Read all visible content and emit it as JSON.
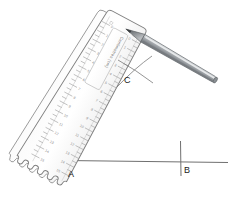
{
  "figure": {
    "background_color": "#ffffff",
    "line_color": "#6e6e6e",
    "label_color": "#1a1a1a"
  },
  "points": [
    {
      "id": "A",
      "label": "A",
      "x": 72,
      "y": 160,
      "role": "vertex-of-angle"
    },
    {
      "id": "B",
      "label": "B",
      "x": 184,
      "y": 168,
      "role": "point-on-base-line"
    },
    {
      "id": "C",
      "label": "C",
      "x": 128,
      "y": 76,
      "role": "arc-intersection-point"
    }
  ],
  "base_line": {
    "name": "horizontal-base-line",
    "x1": 66,
    "y1": 161,
    "x2": 228,
    "y2": 163,
    "color": "#707070"
  },
  "b_tick": {
    "name": "vertical-tick-at-b",
    "x1": 180,
    "y1": 141,
    "x2": 181,
    "y2": 176,
    "color": "#707070"
  },
  "ruler": {
    "name": "plastic-ruler",
    "label_text": "Centimetres (cm)",
    "angle_deg": 28,
    "fill_color": "#fdfdfd",
    "edge_color": "#8b8b8b",
    "tick_color": "#9a9a9a",
    "scalloped_edge": true,
    "numbers": [
      "0",
      "1",
      "2",
      "3",
      "4",
      "5",
      "6",
      "7",
      "8",
      "9",
      "10",
      "11",
      "12",
      "13",
      "14",
      "15"
    ]
  },
  "pencil": {
    "name": "pencil",
    "body_color_light": "#d9dbdd",
    "body_color_mid": "#9ea2a6",
    "body_color_dark": "#6f7479",
    "tip_color": "#4a4d50",
    "angle_deg": 28,
    "tip_x": 134,
    "tip_y": 33
  },
  "arcs": {
    "name": "construction-arc-marks",
    "color": "#777777",
    "strokes": [
      {
        "x1": 120,
        "y1": 62,
        "x2": 152,
        "y2": 82
      },
      {
        "x1": 150,
        "y1": 58,
        "x2": 118,
        "y2": 86
      }
    ]
  },
  "angle_line": {
    "name": "angle-ray-from-a-to-c",
    "x1": 72,
    "y1": 160,
    "x2": 136,
    "y2": 32,
    "color": "#4d4d4d"
  }
}
